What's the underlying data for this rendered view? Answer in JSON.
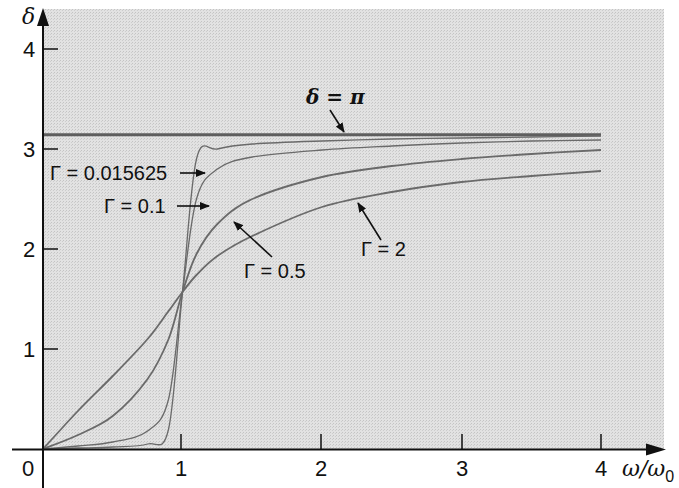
{
  "chart_data": {
    "type": "line",
    "title": "",
    "xlabel": "ω/ω0",
    "ylabel": "δ",
    "xlim": [
      0,
      4
    ],
    "ylim": [
      0,
      4
    ],
    "grid": false,
    "legend": "inline annotations with arrows",
    "x_ticks": [
      "0",
      "1",
      "2",
      "3",
      "4"
    ],
    "y_ticks": [
      "1",
      "2",
      "3",
      "4"
    ],
    "x": [
      0,
      0.25,
      0.5,
      0.75,
      0.9,
      1.0,
      1.1,
      1.25,
      1.5,
      2,
      2.5,
      3,
      3.5,
      4
    ],
    "series": [
      {
        "name": "Γ = 0.015625",
        "values": [
          0,
          0.01,
          0.02,
          0.05,
          0.2,
          1.57,
          2.9,
          3.0,
          3.05,
          3.08,
          3.1,
          3.11,
          3.12,
          3.13
        ]
      },
      {
        "name": "Γ = 0.1",
        "values": [
          0,
          0.03,
          0.07,
          0.18,
          0.5,
          1.57,
          2.5,
          2.8,
          2.92,
          2.99,
          3.03,
          3.06,
          3.08,
          3.09
        ]
      },
      {
        "name": "Γ = 0.5",
        "values": [
          0,
          0.14,
          0.33,
          0.7,
          1.1,
          1.57,
          1.95,
          2.25,
          2.5,
          2.72,
          2.83,
          2.9,
          2.95,
          2.99
        ]
      },
      {
        "name": "Γ = 2",
        "values": [
          0,
          0.38,
          0.73,
          1.1,
          1.38,
          1.57,
          1.74,
          1.93,
          2.13,
          2.42,
          2.57,
          2.67,
          2.73,
          2.78
        ]
      }
    ],
    "reference_lines": [
      {
        "name": "δ = π",
        "y": 3.1416
      }
    ],
    "annotations": [
      {
        "text": "δ = π",
        "target": "horizontal line at π"
      },
      {
        "text": "Γ = 0.015625",
        "target": "Γ = 0.015625 curve"
      },
      {
        "text": "Γ = 0.1",
        "target": "Γ = 0.1 curve"
      },
      {
        "text": "Γ = 0.5",
        "target": "Γ = 0.5 curve"
      },
      {
        "text": "Γ = 2",
        "target": "Γ = 2 curve"
      }
    ]
  },
  "labels": {
    "y_axis": "δ",
    "x_axis_main": "ω/ω",
    "x_axis_sub": "0",
    "origin": "0",
    "x_tick_1": "1",
    "x_tick_2": "2",
    "x_tick_3": "3",
    "x_tick_4": "4",
    "y_tick_1": "1",
    "y_tick_2": "2",
    "y_tick_3": "3",
    "y_tick_4": "4",
    "ann_pi": "δ = π",
    "ann_g1": "Γ = 0.015625",
    "ann_g2": "Γ = 0.1",
    "ann_g3": "Γ = 0.5",
    "ann_g4": "Γ = 2"
  },
  "colors": {
    "plot_background": "#d9d9d9",
    "curve": "#6a6a6a",
    "pi_line": "#5a5a5a",
    "axis": "#111111"
  }
}
